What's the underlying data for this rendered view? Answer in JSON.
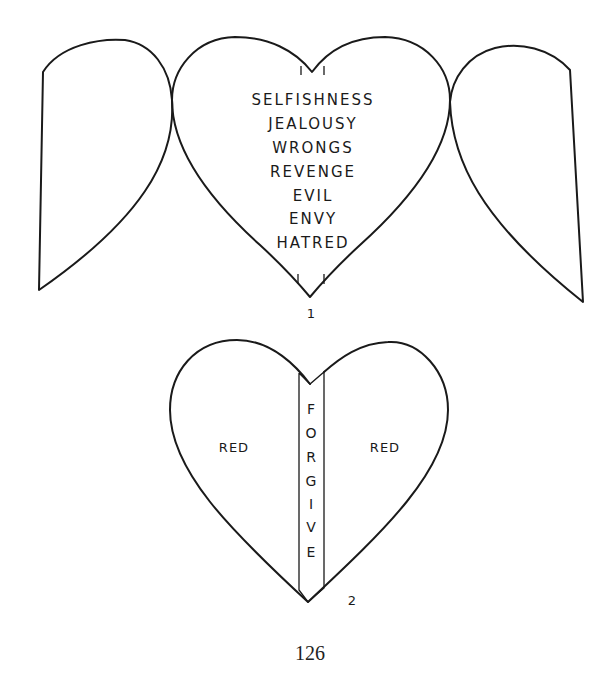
{
  "figure1": {
    "number": "1",
    "words": [
      "SELFISHNESS",
      "JEALOUSY",
      "WRONGS",
      "REVENGE",
      "EVIL",
      "ENVY",
      "HATRED"
    ]
  },
  "figure2": {
    "number": "2",
    "left_label": "RED",
    "right_label": "RED",
    "strip_letters": [
      "F",
      "O",
      "R",
      "G",
      "I",
      "V",
      "E"
    ]
  },
  "page_number": "126"
}
